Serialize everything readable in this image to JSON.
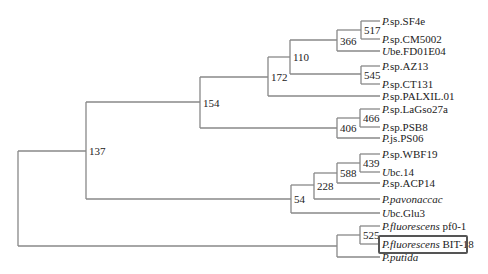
{
  "tree": {
    "line_color": "#888888",
    "leaf_x": 380,
    "leaves": [
      {
        "genus": "P.",
        "name": "sp.SF4e",
        "y": 21
      },
      {
        "genus": "P.",
        "name": "sp.CM5002",
        "y": 39
      },
      {
        "genus": "U",
        "name": "be.FD01E04",
        "y": 51
      },
      {
        "genus": "P.",
        "name": "sp.AZ13",
        "y": 66
      },
      {
        "genus": "P.",
        "name": "sp.CT131",
        "y": 84
      },
      {
        "genus": "P.",
        "name": "sp.PALXIL.01",
        "y": 96
      },
      {
        "genus": "P.",
        "name": "sp.LaGso27a",
        "y": 109
      },
      {
        "genus": "P.",
        "name": "sp.PSB8",
        "y": 127
      },
      {
        "genus": "P.",
        "name": "js.PS06",
        "y": 138
      },
      {
        "genus": "P.",
        "name": "sp.WBF19",
        "y": 154
      },
      {
        "genus": "U",
        "name": "bc.14",
        "y": 172
      },
      {
        "genus": "P.",
        "name": "sp.ACP14",
        "y": 183
      },
      {
        "genus": "P.pavonaccac",
        "name": "",
        "y": 199
      },
      {
        "genus": "U",
        "name": "bc.Glu3",
        "y": 213
      },
      {
        "genus": "P.fluorescens",
        "name": "pf0-1",
        "y": 226
      },
      {
        "genus": "P.fluorescens",
        "name": "BIT-18",
        "y": 244,
        "highlight": true
      },
      {
        "genus": "P.putida",
        "name": "",
        "y": 257
      }
    ],
    "nodes": [
      {
        "id": "root",
        "label": "",
        "x": 18,
        "y1": 151,
        "y2": 246,
        "px": null
      },
      {
        "id": "n137",
        "label": "137",
        "x": 86,
        "y1": 102,
        "y2": 199,
        "parent_y": 151
      },
      {
        "id": "n154",
        "label": "154",
        "x": 200,
        "y1": 77,
        "y2": 128,
        "parent_y": 102
      },
      {
        "id": "n172",
        "label": "172",
        "x": 268,
        "y1": 57,
        "y2": 96,
        "parent_y": 77
      },
      {
        "id": "n110",
        "label": "110",
        "x": 290,
        "y1": 40,
        "y2": 74,
        "parent_y": 57
      },
      {
        "id": "n366",
        "label": "366",
        "x": 337,
        "y1": 30,
        "y2": 51,
        "parent_y": 40
      },
      {
        "id": "n517",
        "label": "517",
        "x": 361,
        "y1": 21,
        "y2": 39,
        "parent_y": 30
      },
      {
        "id": "n545",
        "label": "545",
        "x": 361,
        "y1": 66,
        "y2": 84,
        "parent_y": 74
      },
      {
        "id": "n406",
        "label": "406",
        "x": 337,
        "y1": 118,
        "y2": 138,
        "parent_y": 128
      },
      {
        "id": "n466",
        "label": "466",
        "x": 360,
        "y1": 109,
        "y2": 127,
        "parent_y": 118
      },
      {
        "id": "n54",
        "label": "54",
        "x": 291,
        "y1": 185,
        "y2": 213,
        "parent_y": 199
      },
      {
        "id": "n228",
        "label": "228",
        "x": 314,
        "y1": 173,
        "y2": 199,
        "parent_y": 185
      },
      {
        "id": "n588",
        "label": "588",
        "x": 337,
        "y1": 163,
        "y2": 183,
        "parent_y": 173
      },
      {
        "id": "n439",
        "label": "439",
        "x": 360,
        "y1": 154,
        "y2": 172,
        "parent_y": 163
      },
      {
        "id": "nPf",
        "label": "",
        "x": 337,
        "y1": 235,
        "y2": 257,
        "parent_y": 246
      },
      {
        "id": "n525",
        "label": "525",
        "x": 360,
        "y1": 226,
        "y2": 244,
        "parent_y": 235
      }
    ]
  }
}
